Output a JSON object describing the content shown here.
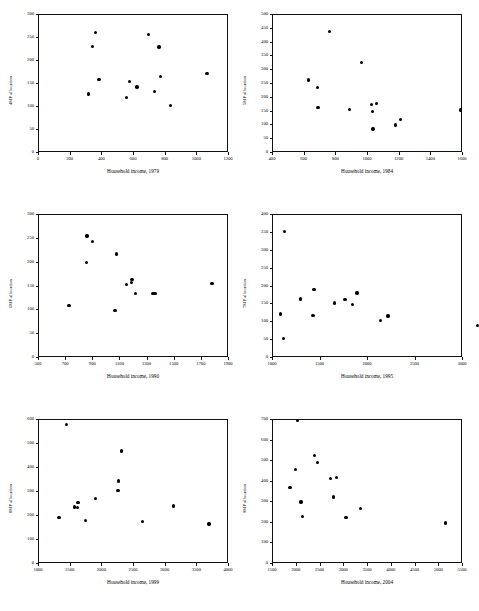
{
  "figure": {
    "type": "scatter-matrix",
    "panel_count": 6,
    "layout": "2 columns x 3 rows",
    "marker_color": "#000000",
    "axis_color": "#111111",
    "background": "#ffffff",
    "cropped_header_text": ""
  },
  "chart_data": [
    {
      "type": "scatter",
      "title": "",
      "xlabel": "Household income, 1979",
      "ylabel": "4MP allocation",
      "xlim": [
        0,
        1200
      ],
      "ylim": [
        0,
        300
      ],
      "xticks": [
        0,
        200,
        400,
        600,
        800,
        1000,
        1200
      ],
      "yticks": [
        0,
        50,
        100,
        150,
        200,
        250,
        300
      ],
      "grid": false,
      "legend": "none",
      "points": [
        {
          "x": 318,
          "y": 126
        },
        {
          "x": 345,
          "y": 229
        },
        {
          "x": 362,
          "y": 260
        },
        {
          "x": 385,
          "y": 157
        },
        {
          "x": 560,
          "y": 118
        },
        {
          "x": 578,
          "y": 153
        },
        {
          "x": 625,
          "y": 141
        },
        {
          "x": 700,
          "y": 256
        },
        {
          "x": 735,
          "y": 132
        },
        {
          "x": 765,
          "y": 228
        },
        {
          "x": 772,
          "y": 164
        },
        {
          "x": 838,
          "y": 101
        },
        {
          "x": 1068,
          "y": 170
        }
      ]
    },
    {
      "type": "scatter",
      "title": "",
      "xlabel": "Household income, 1984",
      "ylabel": "5MP allocation",
      "xlim": [
        400,
        1600
      ],
      "ylim": [
        0,
        500
      ],
      "xticks": [
        400,
        600,
        800,
        1000,
        1200,
        1400,
        1600
      ],
      "yticks": [
        0,
        50,
        100,
        150,
        200,
        250,
        300,
        350,
        400,
        450,
        500
      ],
      "grid": false,
      "legend": "none",
      "points": [
        {
          "x": 630,
          "y": 261
        },
        {
          "x": 688,
          "y": 233
        },
        {
          "x": 690,
          "y": 162
        },
        {
          "x": 763,
          "y": 437
        },
        {
          "x": 888,
          "y": 154
        },
        {
          "x": 963,
          "y": 324
        },
        {
          "x": 1030,
          "y": 172
        },
        {
          "x": 1034,
          "y": 148
        },
        {
          "x": 1037,
          "y": 83
        },
        {
          "x": 1058,
          "y": 176
        },
        {
          "x": 1178,
          "y": 98
        },
        {
          "x": 1213,
          "y": 117
        },
        {
          "x": 1592,
          "y": 152
        }
      ]
    },
    {
      "type": "scatter",
      "title": "",
      "xlabel": "Household income, 1990",
      "ylabel": "6MP allocation",
      "xlim": [
        500,
        1900
      ],
      "ylim": [
        0,
        300
      ],
      "xticks": [
        500,
        700,
        900,
        1100,
        1300,
        1500,
        1700,
        1900
      ],
      "yticks": [
        0,
        50,
        100,
        150,
        200,
        250,
        300
      ],
      "grid": false,
      "legend": "none",
      "points": [
        {
          "x": 728,
          "y": 108
        },
        {
          "x": 858,
          "y": 199
        },
        {
          "x": 862,
          "y": 254
        },
        {
          "x": 902,
          "y": 242
        },
        {
          "x": 1068,
          "y": 98
        },
        {
          "x": 1078,
          "y": 216
        },
        {
          "x": 1152,
          "y": 152
        },
        {
          "x": 1188,
          "y": 157
        },
        {
          "x": 1192,
          "y": 163
        },
        {
          "x": 1218,
          "y": 133
        },
        {
          "x": 1348,
          "y": 133
        },
        {
          "x": 1362,
          "y": 133
        },
        {
          "x": 1782,
          "y": 154
        }
      ]
    },
    {
      "type": "scatter",
      "title": "",
      "xlabel": "Household income, 1995",
      "ylabel": "7MP allocation",
      "xlim": [
        1000,
        3000
      ],
      "ylim": [
        0,
        400
      ],
      "xticks": [
        1000,
        1500,
        2000,
        2500,
        3000
      ],
      "yticks": [
        0,
        50,
        100,
        150,
        200,
        250,
        300,
        350,
        400
      ],
      "grid": false,
      "legend": "none",
      "points": [
        {
          "x": 1090,
          "y": 120
        },
        {
          "x": 1118,
          "y": 52
        },
        {
          "x": 1128,
          "y": 352
        },
        {
          "x": 1300,
          "y": 162
        },
        {
          "x": 1432,
          "y": 117
        },
        {
          "x": 1442,
          "y": 189
        },
        {
          "x": 1660,
          "y": 151
        },
        {
          "x": 1768,
          "y": 160
        },
        {
          "x": 1845,
          "y": 146
        },
        {
          "x": 1895,
          "y": 179
        },
        {
          "x": 2145,
          "y": 103
        },
        {
          "x": 2222,
          "y": 115
        },
        {
          "x": 3162,
          "y": 88
        }
      ]
    },
    {
      "type": "scatter",
      "title": "",
      "xlabel": "Household income, 1999",
      "ylabel": "8MP allocation",
      "xlim": [
        1000,
        4000
      ],
      "ylim": [
        0,
        600
      ],
      "xticks": [
        1000,
        1500,
        2000,
        2500,
        3000,
        3500,
        4000
      ],
      "yticks": [
        0,
        100,
        200,
        300,
        400,
        500,
        600
      ],
      "grid": false,
      "legend": "none",
      "points": [
        {
          "x": 1332,
          "y": 189
        },
        {
          "x": 1448,
          "y": 577
        },
        {
          "x": 1578,
          "y": 233
        },
        {
          "x": 1622,
          "y": 231
        },
        {
          "x": 1632,
          "y": 253
        },
        {
          "x": 1748,
          "y": 178
        },
        {
          "x": 1905,
          "y": 269
        },
        {
          "x": 2262,
          "y": 303
        },
        {
          "x": 2272,
          "y": 342
        },
        {
          "x": 2320,
          "y": 467
        },
        {
          "x": 2648,
          "y": 172
        },
        {
          "x": 3135,
          "y": 238
        },
        {
          "x": 3698,
          "y": 162
        }
      ]
    },
    {
      "type": "scatter",
      "title": "",
      "xlabel": "Household income, 2004",
      "ylabel": "9MP allocation",
      "xlim": [
        1500,
        5500
      ],
      "ylim": [
        0,
        700
      ],
      "xticks": [
        1500,
        2000,
        2500,
        3000,
        3500,
        4000,
        4500,
        5000,
        5500
      ],
      "yticks": [
        0,
        100,
        200,
        300,
        400,
        500,
        600,
        700
      ],
      "grid": false,
      "legend": "none",
      "points": [
        {
          "x": 1880,
          "y": 367
        },
        {
          "x": 1992,
          "y": 455
        },
        {
          "x": 2042,
          "y": 692
        },
        {
          "x": 2108,
          "y": 296
        },
        {
          "x": 2148,
          "y": 225
        },
        {
          "x": 2395,
          "y": 523
        },
        {
          "x": 2462,
          "y": 489
        },
        {
          "x": 2730,
          "y": 412
        },
        {
          "x": 2790,
          "y": 321
        },
        {
          "x": 2862,
          "y": 414
        },
        {
          "x": 3055,
          "y": 222
        },
        {
          "x": 3362,
          "y": 265
        },
        {
          "x": 5150,
          "y": 194
        }
      ]
    }
  ]
}
